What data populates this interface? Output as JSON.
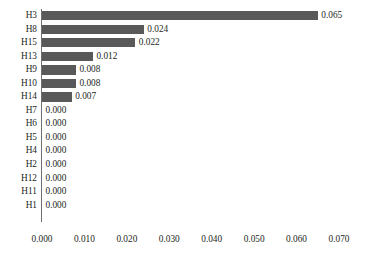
{
  "chart_data": {
    "type": "bar",
    "orientation": "horizontal",
    "title": "",
    "xlabel": "",
    "ylabel": "",
    "xlim": [
      0.0,
      0.07
    ],
    "grid": false,
    "legend": null,
    "bar_color": "#595959",
    "value_format": "0.000",
    "xticks": [
      "0.000",
      "0.010",
      "0.020",
      "0.030",
      "0.040",
      "0.050",
      "0.060",
      "0.070"
    ],
    "xtick_values": [
      0.0,
      0.01,
      0.02,
      0.03,
      0.04,
      0.05,
      0.06,
      0.07
    ],
    "categories": [
      "H3",
      "H8",
      "H15",
      "H13",
      "H9",
      "H10",
      "H14",
      "H7",
      "H6",
      "H5",
      "H4",
      "H2",
      "H12",
      "H11",
      "H1"
    ],
    "values": [
      0.065,
      0.024,
      0.022,
      0.012,
      0.008,
      0.008,
      0.007,
      0.0,
      0.0,
      0.0,
      0.0,
      0.0,
      0.0,
      0.0,
      0.0
    ],
    "value_labels": [
      "0.065",
      "0.024",
      "0.022",
      "0.012",
      "0.008",
      "0.008",
      "0.007",
      "0.000",
      "0.000",
      "0.000",
      "0.000",
      "0.000",
      "0.000",
      "0.000",
      "0.000"
    ]
  }
}
